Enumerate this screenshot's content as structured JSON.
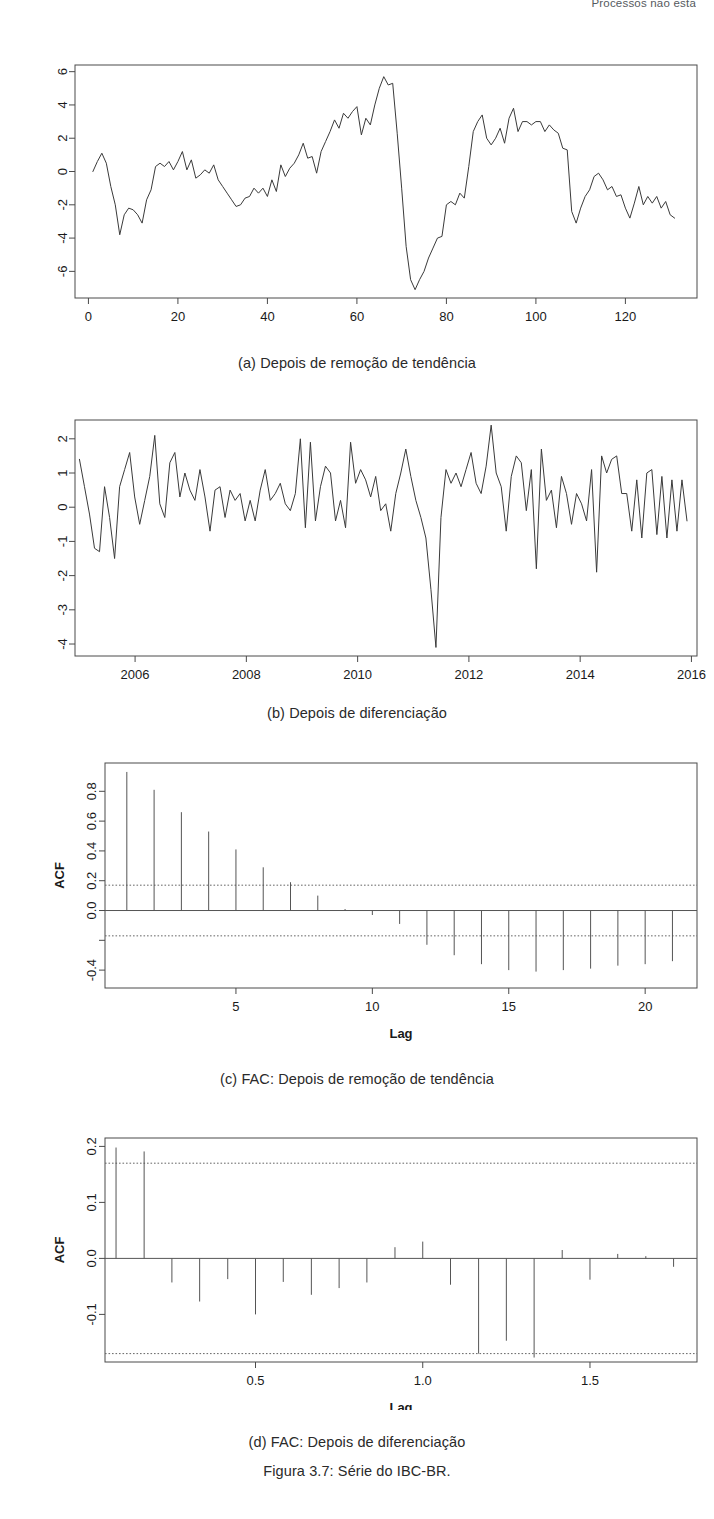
{
  "running_head": "Processos não esta",
  "figure": {
    "caption": "Figura 3.7: Série do IBC-BR."
  },
  "panels": [
    {
      "id": "a",
      "caption": "(a) Depois de remoção de tendência"
    },
    {
      "id": "b",
      "caption": "(b) Depois de diferenciação"
    },
    {
      "id": "c",
      "caption": "(c) FAC: Depois de remoção de tendência"
    },
    {
      "id": "d",
      "caption": "(d) FAC: Depois de diferenciação"
    }
  ],
  "chart_data": [
    {
      "type": "line",
      "panel": "a",
      "title": "(a) Depois de remoção de tendência",
      "xlabel": "",
      "ylabel": "",
      "xlim": [
        -3,
        136
      ],
      "ylim": [
        -7.6,
        6.4
      ],
      "xticks": [
        0,
        20,
        40,
        60,
        80,
        100,
        120
      ],
      "yticks": [
        -6,
        -4,
        -2,
        0,
        2,
        4,
        6
      ],
      "grid": false,
      "legend": "none",
      "x": [
        1,
        2,
        3,
        4,
        5,
        6,
        7,
        8,
        9,
        10,
        11,
        12,
        13,
        14,
        15,
        16,
        17,
        18,
        19,
        20,
        21,
        22,
        23,
        24,
        25,
        26,
        27,
        28,
        29,
        30,
        31,
        32,
        33,
        34,
        35,
        36,
        37,
        38,
        39,
        40,
        41,
        42,
        43,
        44,
        45,
        46,
        47,
        48,
        49,
        50,
        51,
        52,
        53,
        54,
        55,
        56,
        57,
        58,
        59,
        60,
        61,
        62,
        63,
        64,
        65,
        66,
        67,
        68,
        69,
        70,
        71,
        72,
        73,
        74,
        75,
        76,
        77,
        78,
        79,
        80,
        81,
        82,
        83,
        84,
        85,
        86,
        87,
        88,
        89,
        90,
        91,
        92,
        93,
        94,
        95,
        96,
        97,
        98,
        99,
        100,
        101,
        102,
        103,
        104,
        105,
        106,
        107,
        108,
        109,
        110,
        111,
        112,
        113,
        114,
        115,
        116,
        117,
        118,
        119,
        120,
        121,
        122,
        123,
        124,
        125,
        126,
        127,
        128,
        129,
        130,
        131,
        132
      ],
      "values": [
        0.0,
        0.6,
        1.1,
        0.5,
        -0.9,
        -2.0,
        -3.8,
        -2.6,
        -2.2,
        -2.3,
        -2.6,
        -3.1,
        -1.7,
        -1.1,
        0.3,
        0.5,
        0.3,
        0.6,
        0.1,
        0.6,
        1.2,
        0.1,
        0.7,
        -0.4,
        -0.2,
        0.1,
        -0.1,
        0.4,
        -0.5,
        -0.9,
        -1.3,
        -1.7,
        -2.1,
        -2.0,
        -1.6,
        -1.5,
        -1.0,
        -1.3,
        -1.0,
        -1.5,
        -0.5,
        -1.2,
        0.4,
        -0.3,
        0.2,
        0.5,
        1.0,
        1.7,
        0.8,
        0.9,
        -0.1,
        1.2,
        1.8,
        2.4,
        3.1,
        2.6,
        3.5,
        3.2,
        3.6,
        3.9,
        2.2,
        3.2,
        2.8,
        4.0,
        5.0,
        5.7,
        5.2,
        5.3,
        2.3,
        -1.0,
        -4.5,
        -6.5,
        -7.1,
        -6.5,
        -6.0,
        -5.2,
        -4.6,
        -4.0,
        -3.9,
        -2.0,
        -1.8,
        -2.0,
        -1.3,
        -1.6,
        0.3,
        2.4,
        3.0,
        3.4,
        2.0,
        1.6,
        2.0,
        2.6,
        1.7,
        3.2,
        3.8,
        2.4,
        3.0,
        3.0,
        2.8,
        3.0,
        3.0,
        2.4,
        2.8,
        2.5,
        2.3,
        1.4,
        1.3,
        -2.4,
        -3.1,
        -2.2,
        -1.5,
        -1.1,
        -0.3,
        -0.1,
        -0.5,
        -1.1,
        -0.9,
        -1.5,
        -1.4,
        -2.2,
        -2.8,
        -1.9,
        -0.9,
        -2.0,
        -1.5,
        -1.9,
        -1.5,
        -2.2,
        -1.8,
        -2.6,
        -2.8
      ]
    },
    {
      "type": "line",
      "panel": "b",
      "title": "(b) Depois de diferenciação",
      "xlabel": "",
      "ylabel": "",
      "xlim": [
        2004.92,
        2016.1
      ],
      "ylim": [
        -4.35,
        2.55
      ],
      "xticks": [
        2006,
        2008,
        2010,
        2012,
        2014,
        2016
      ],
      "yticks": [
        -4,
        -3,
        -2,
        -1,
        0,
        1,
        2
      ],
      "grid": false,
      "legend": "none",
      "values": [
        1.4,
        0.6,
        -0.2,
        -1.2,
        -1.3,
        0.6,
        -0.3,
        -1.5,
        0.6,
        1.1,
        1.6,
        0.3,
        -0.5,
        0.2,
        0.9,
        2.1,
        0.1,
        -0.3,
        1.3,
        1.6,
        0.3,
        1.0,
        0.5,
        0.2,
        1.1,
        0.3,
        -0.7,
        0.5,
        0.6,
        -0.3,
        0.5,
        0.2,
        0.4,
        -0.4,
        0.2,
        -0.4,
        0.5,
        1.1,
        0.2,
        0.4,
        0.7,
        0.1,
        -0.1,
        0.4,
        2.0,
        -0.6,
        1.9,
        -0.4,
        0.6,
        1.2,
        1.0,
        -0.4,
        0.2,
        -0.6,
        1.9,
        0.7,
        1.1,
        0.8,
        0.3,
        0.9,
        -0.1,
        0.1,
        -0.7,
        0.4,
        1.0,
        1.7,
        0.9,
        0.2,
        -0.3,
        -0.9,
        -2.4,
        -4.1,
        -0.3,
        1.1,
        0.7,
        1.0,
        0.6,
        1.1,
        1.6,
        0.7,
        0.4,
        1.2,
        2.4,
        1.0,
        0.6,
        -0.7,
        0.9,
        1.5,
        1.3,
        -0.1,
        1.1,
        -1.8,
        1.7,
        0.2,
        0.5,
        -0.6,
        0.9,
        0.4,
        -0.5,
        0.4,
        0.1,
        -0.4,
        1.1,
        -1.9,
        1.5,
        1.0,
        1.4,
        1.5,
        0.4,
        0.4,
        -0.7,
        0.8,
        -0.9,
        1.0,
        1.1,
        -0.8,
        0.9,
        -0.9,
        0.8,
        -0.7,
        0.8,
        -0.4
      ]
    },
    {
      "type": "bar",
      "panel": "c",
      "title": "(c) FAC: Depois de remoção de tendência",
      "xlabel": "Lag",
      "ylabel": "ACF",
      "xlim": [
        0.2,
        21.9
      ],
      "ylim": [
        -0.52,
        0.99
      ],
      "xticks": [
        5,
        10,
        15,
        20
      ],
      "yticks": [
        -0.4,
        -0.2,
        0.0,
        0.2,
        0.4,
        0.6,
        0.8
      ],
      "ytick_labels": [
        "-0.4",
        "",
        "0.0",
        "0.2",
        "0.4",
        "0.6",
        "0.8"
      ],
      "grid": false,
      "legend": "none",
      "conf_limits": [
        0.17,
        -0.17
      ],
      "categories": [
        1,
        2,
        3,
        4,
        5,
        6,
        7,
        8,
        9,
        10,
        11,
        12,
        13,
        14,
        15,
        16,
        17,
        18,
        19,
        20,
        21
      ],
      "values": [
        0.93,
        0.81,
        0.66,
        0.53,
        0.41,
        0.29,
        0.19,
        0.1,
        0.01,
        -0.03,
        -0.09,
        -0.23,
        -0.3,
        -0.36,
        -0.4,
        -0.41,
        -0.4,
        -0.39,
        -0.37,
        -0.36,
        -0.34
      ]
    },
    {
      "type": "bar",
      "panel": "d",
      "title": "(d) FAC: Depois de diferenciação",
      "xlabel": "Lag",
      "ylabel": "ACF",
      "xlim": [
        0.05,
        1.82
      ],
      "ylim": [
        -0.185,
        0.215
      ],
      "xticks": [
        0.5,
        1.0,
        1.5
      ],
      "yticks": [
        -0.1,
        0.0,
        0.1,
        0.2
      ],
      "grid": false,
      "legend": "none",
      "conf_limits": [
        0.17,
        -0.17
      ],
      "categories": [
        0.083,
        0.167,
        0.25,
        0.333,
        0.417,
        0.5,
        0.583,
        0.667,
        0.75,
        0.833,
        0.917,
        1.0,
        1.083,
        1.167,
        1.25,
        1.333,
        1.417,
        1.5,
        1.583,
        1.667,
        1.75
      ],
      "values": [
        0.198,
        0.191,
        -0.043,
        -0.077,
        -0.037,
        -0.1,
        -0.042,
        -0.065,
        -0.053,
        -0.043,
        0.02,
        0.03,
        -0.047,
        -0.17,
        -0.147,
        -0.177,
        0.015,
        -0.038,
        0.008,
        0.004,
        -0.015
      ]
    }
  ]
}
